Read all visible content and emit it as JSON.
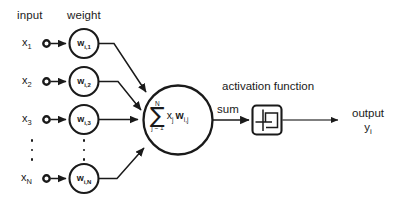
{
  "diagram": {
    "title_headers": {
      "input": "input",
      "weight": "weight"
    },
    "captions": {
      "activation_function": "activation function",
      "sum": "sum"
    },
    "output": {
      "label": "output",
      "symbol": "y",
      "symbol_sub": "i"
    },
    "inputs": [
      {
        "symbol": "x",
        "sub": "1"
      },
      {
        "symbol": "x",
        "sub": "2"
      },
      {
        "symbol": "x",
        "sub": "3"
      },
      {
        "symbol": "x",
        "sub": "N"
      }
    ],
    "weights": [
      {
        "symbol": "w",
        "sub": "i,1"
      },
      {
        "symbol": "w",
        "sub": "i,2"
      },
      {
        "symbol": "w",
        "sub": "i,3"
      },
      {
        "symbol": "w",
        "sub": "i,N"
      }
    ],
    "summation_node": {
      "operator": "∑",
      "upper_limit": "N",
      "lower_limit": "j = 1",
      "terms_x": "x",
      "terms_x_sub": "j",
      "terms_w": "w",
      "terms_w_sub": "i,j"
    },
    "activation_symbol": "step-function",
    "ellipsis_count": 3,
    "colors": {
      "stroke": "#1a1a1a",
      "background": "#ffffff",
      "text": "#1d1d1d"
    }
  }
}
